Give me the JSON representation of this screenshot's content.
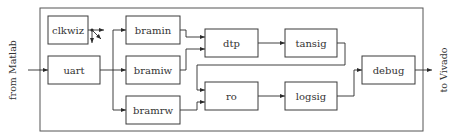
{
  "diagram": {
    "input_label": "from Matlab",
    "output_label": "to Vivado",
    "blocks": {
      "clkwiz": "clkwiz",
      "uart": "uart",
      "bramin": "bramin",
      "bramiw": "bramiw",
      "bramrw": "bramrw",
      "dtp": "dtp",
      "tansig": "tansig",
      "ro": "ro",
      "logsig": "logsig",
      "debug": "debug"
    },
    "connections": [
      {
        "from": "from Matlab",
        "to": "uart"
      },
      {
        "from": "uart",
        "to": "bramin"
      },
      {
        "from": "uart",
        "to": "bramiw"
      },
      {
        "from": "uart",
        "to": "bramrw"
      },
      {
        "from": "bramin",
        "to": "dtp"
      },
      {
        "from": "bramiw",
        "to": "dtp"
      },
      {
        "from": "dtp",
        "to": "tansig"
      },
      {
        "from": "tansig",
        "to": "ro"
      },
      {
        "from": "bramrw",
        "to": "ro"
      },
      {
        "from": "ro",
        "to": "logsig"
      },
      {
        "from": "logsig",
        "to": "debug"
      },
      {
        "from": "debug",
        "to": "to Vivado"
      },
      {
        "from": "clkwiz",
        "to": "clock fan-out"
      }
    ],
    "colors": {
      "stroke": "#3a3a3a",
      "background": "#ffffff",
      "text": "#333333"
    }
  }
}
